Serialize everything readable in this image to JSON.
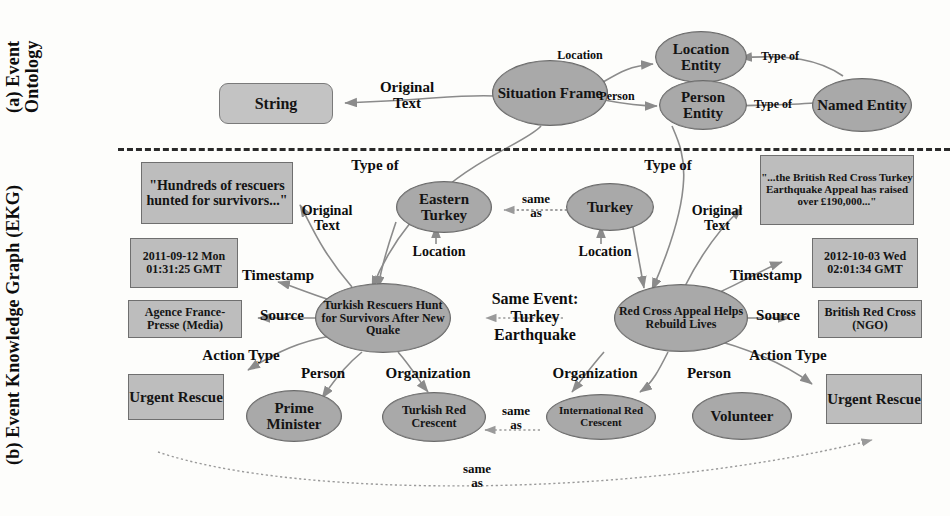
{
  "figure": {
    "panels": [
      {
        "id": "a",
        "label": "(a) Event\nOntology"
      },
      {
        "id": "b",
        "label": "(b) Event\nKnowledge Graph\n(EKG)"
      }
    ]
  },
  "ontology": {
    "nodes": {
      "string": "String",
      "situation_frame": "Situation\nFrame",
      "location_entity": "Location\nEntity",
      "person_entity": "Person\nEntity",
      "named_entity": "Named\nEntity"
    },
    "edges": {
      "original_text": "Original\nText",
      "location": "Location",
      "person": "Person",
      "type_of_location": "Type of",
      "type_of_person": "Type of"
    }
  },
  "ekg": {
    "nodes": {
      "left_text": "\"Hundreds of\nrescuers hunted\nfor survivors...\"",
      "left_timestamp": "2011-09-12\nMon 01:31:25\nGMT",
      "left_source": "Agence France-\nPresse (Media)",
      "left_action": "Urgent\nRescue",
      "left_event": "Turkish Rescuers\nHunt for\nSurvivors After\nNew Quake",
      "left_person": "Prime\nMinister",
      "left_org": "Turkish Red\nCrescent",
      "left_location": "Eastern\nTurkey",
      "right_location": "Turkey",
      "right_text": "\"...the British Red\nCross Turkey\nEarthquake Appeal\nhas raised over\n£190,000...\"",
      "right_timestamp": "2012-10-03\nWed 02:01:34\nGMT",
      "right_source": "British Red\nCross (NGO)",
      "right_action": "Urgent\nRescue",
      "right_event": "Red Cross Appeal\nHelps Rebuild\nLives",
      "right_person": "Volunteer",
      "right_org": "International\nRed Crescent"
    },
    "edges": {
      "type_of_left": "Type of",
      "type_of_right": "Type of",
      "original_text_left": "Original\nText",
      "original_text_right": "Original\nText",
      "timestamp_left": "Timestamp",
      "timestamp_right": "Timestamp",
      "source_left": "Source",
      "source_right": "Source",
      "action_type_left": "Action Type",
      "action_type_right": "Action Type",
      "person_left": "Person",
      "person_right": "Person",
      "organization_left": "Organization",
      "organization_right": "Organization",
      "location_left": "Location",
      "location_right": "Location",
      "same_as_locations": "same\nas",
      "same_as_orgs": "same\nas",
      "same_as_actions": "same\nas",
      "same_event": "Same Event:\nTurkey\nEarthquake"
    }
  },
  "colors": {
    "ellipse_fill": "#a9a9a9",
    "rect_fill": "#bdbdbd",
    "rounded_rect_fill": "#c3c3c3",
    "stroke": "#6f6f6f",
    "edge": "#8b8b8b",
    "text": "#111111",
    "background": "#fdfdfb"
  }
}
